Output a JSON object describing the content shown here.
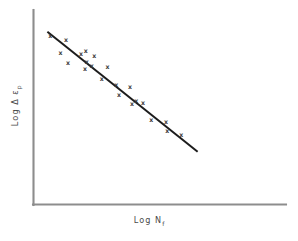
{
  "figure": {
    "background_color": "#ffffff",
    "axis_color": "#8d8d8d",
    "line_color": "#1c1c1c",
    "marker_color": "#3a3a3a"
  },
  "axes": {
    "x_label_main": "Log",
    "x_label_symbol": "N",
    "x_label_subscript": "f",
    "x_label_full": "Log N f",
    "y_label_main": "Log",
    "y_label_symbol": "Δ ε",
    "y_label_subscript": "p",
    "y_label_full": "Log Δ ε p"
  },
  "chart_data": {
    "type": "scatter",
    "title": "",
    "subtitle": "",
    "xlabel": "Log N f",
    "ylabel": "Log Δ ε p",
    "xlim": [
      0,
      10
    ],
    "ylim": [
      0,
      10
    ],
    "grid": false,
    "legend": null,
    "axis_ticks": {
      "x": [],
      "y": []
    },
    "marker_symbol": "x",
    "series": [
      {
        "name": "plastic strain data",
        "marker": "x",
        "points": [
          {
            "x": 0.66,
            "y": 8.66
          },
          {
            "x": 1.29,
            "y": 8.42
          },
          {
            "x": 1.07,
            "y": 7.75
          },
          {
            "x": 1.37,
            "y": 7.24
          },
          {
            "x": 1.88,
            "y": 7.7
          },
          {
            "x": 2.07,
            "y": 7.86
          },
          {
            "x": 2.11,
            "y": 7.32
          },
          {
            "x": 2.04,
            "y": 6.96
          },
          {
            "x": 2.41,
            "y": 7.63
          },
          {
            "x": 2.31,
            "y": 7.11
          },
          {
            "x": 2.93,
            "y": 7.03
          },
          {
            "x": 2.7,
            "y": 6.45
          },
          {
            "x": 3.28,
            "y": 6.11
          },
          {
            "x": 3.39,
            "y": 5.62
          },
          {
            "x": 3.82,
            "y": 6.01
          },
          {
            "x": 4.07,
            "y": 5.29
          },
          {
            "x": 3.9,
            "y": 5.13
          },
          {
            "x": 4.34,
            "y": 5.2
          },
          {
            "x": 4.66,
            "y": 4.33
          },
          {
            "x": 5.25,
            "y": 4.21
          },
          {
            "x": 5.3,
            "y": 3.77
          },
          {
            "x": 5.85,
            "y": 3.56
          }
        ]
      }
    ],
    "fit_line": {
      "name": "best fit trend",
      "style": "solid",
      "start": {
        "x": 0.55,
        "y": 8.88
      },
      "end": {
        "x": 6.5,
        "y": 2.71
      },
      "slope_sign": "negative",
      "description": "straight descending line through scatter"
    }
  }
}
